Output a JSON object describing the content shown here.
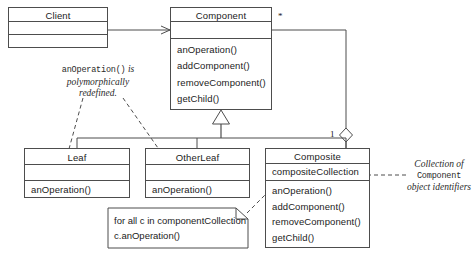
{
  "diagram": {
    "stroke_color": "#4d4d4d",
    "text_color": "#1b1b1b"
  },
  "classes": {
    "client": {
      "name": "Client",
      "attributes": [],
      "operations": []
    },
    "component": {
      "name": "Component",
      "attributes": [],
      "operations": [
        "anOperation()",
        "addComponent()",
        "removeComponent()",
        "getChild()"
      ]
    },
    "leaf": {
      "name": "Leaf",
      "attributes": [],
      "operations": [
        "anOperation()"
      ]
    },
    "otherleaf": {
      "name": "OtherLeaf",
      "attributes": [],
      "operations": [
        "anOperation()"
      ]
    },
    "composite": {
      "name": "Composite",
      "attributes": [
        "compositeCollection"
      ],
      "operations": [
        "anOperation()",
        "addComponent()",
        "removeComponent()",
        "getChild()"
      ]
    }
  },
  "multiplicities": {
    "component_end": "*",
    "composite_end": "1"
  },
  "annotations": {
    "polymorphic": {
      "code": "anOperation()",
      "line1": "is",
      "line2": "polymorphically",
      "line3": "redefined."
    },
    "collection": {
      "line1": "Collection of",
      "code": "Component",
      "line2": "object identifiers"
    }
  },
  "note": {
    "line1": "for all c in componentCollection",
    "line2": "c.anOperation()"
  }
}
